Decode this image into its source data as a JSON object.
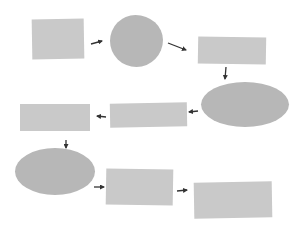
{
  "diagram": {
    "type": "flowchart",
    "layout": "serpentine",
    "colors": {
      "background": "#ffffff",
      "rect_fill": "#c9c9c9",
      "oval_fill": "#b7b7b7",
      "arrow": "#333333"
    },
    "nodes": [
      {
        "id": "n1",
        "shape": "rectangle",
        "label": ""
      },
      {
        "id": "n2",
        "shape": "circle",
        "label": ""
      },
      {
        "id": "n3",
        "shape": "rectangle",
        "label": ""
      },
      {
        "id": "n4",
        "shape": "ellipse",
        "label": ""
      },
      {
        "id": "n5",
        "shape": "rectangle",
        "label": ""
      },
      {
        "id": "n6",
        "shape": "rectangle",
        "label": ""
      },
      {
        "id": "n7",
        "shape": "ellipse",
        "label": ""
      },
      {
        "id": "n8",
        "shape": "rectangle",
        "label": ""
      },
      {
        "id": "n9",
        "shape": "rectangle",
        "label": ""
      }
    ],
    "edges": [
      {
        "from": "n1",
        "to": "n2",
        "direction": "right"
      },
      {
        "from": "n2",
        "to": "n3",
        "direction": "down-right"
      },
      {
        "from": "n3",
        "to": "n4",
        "direction": "down"
      },
      {
        "from": "n4",
        "to": "n5",
        "direction": "left"
      },
      {
        "from": "n5",
        "to": "n6",
        "direction": "left"
      },
      {
        "from": "n6",
        "to": "n7",
        "direction": "down"
      },
      {
        "from": "n7",
        "to": "n8",
        "direction": "right"
      },
      {
        "from": "n8",
        "to": "n9",
        "direction": "right"
      }
    ]
  }
}
